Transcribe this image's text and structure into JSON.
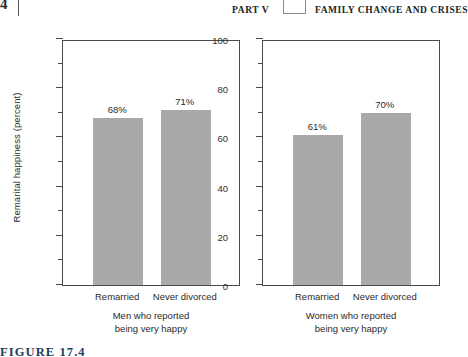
{
  "running_head": {
    "page_number_stub": "4",
    "part_label": "PART V",
    "part_title": "FAMILY CHANGE AND CRISES"
  },
  "figure": {
    "number": "FIGURE 17.4",
    "y_axis_title": "Remarital happiness (percent)"
  },
  "chart_data": {
    "type": "bar",
    "title": "",
    "xlabel": "",
    "ylabel": "Remarital happiness (percent)",
    "ylim": [
      0,
      100
    ],
    "ytick_labels": [
      "0",
      "20",
      "40",
      "60",
      "80",
      "100"
    ],
    "ytick_values": [
      0,
      20,
      40,
      60,
      80,
      100
    ],
    "minor_tick_values": [
      10,
      30,
      50,
      70,
      90
    ],
    "grid": false,
    "legend": "none",
    "panels": [
      {
        "name": "men",
        "caption_line1": "Men who reported",
        "caption_line2": "being very happy",
        "categories": [
          "Remarried",
          "Never divorced"
        ],
        "values": [
          68,
          71
        ],
        "value_labels": [
          "68%",
          "71%"
        ]
      },
      {
        "name": "women",
        "caption_line1": "Women who reported",
        "caption_line2": "being very happy",
        "categories": [
          "Remarried",
          "Never divorced"
        ],
        "values": [
          61,
          70
        ],
        "value_labels": [
          "61%",
          "70%"
        ]
      }
    ],
    "colors": {
      "bar_fill": "#a9a9a9",
      "axis": "#4a4a4a",
      "text": "#2b2b2b",
      "figure_number": "#20405f"
    }
  }
}
